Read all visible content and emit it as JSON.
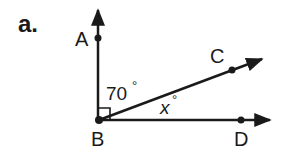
{
  "problem": {
    "part_label": "a."
  },
  "points": {
    "A": "A",
    "B": "B",
    "C": "C",
    "D": "D"
  },
  "angles": {
    "abc_value": "70",
    "cbd_value": "x",
    "degree_symbol": "°"
  },
  "colors": {
    "stroke": "#1a1a1a",
    "background": "#ffffff"
  }
}
